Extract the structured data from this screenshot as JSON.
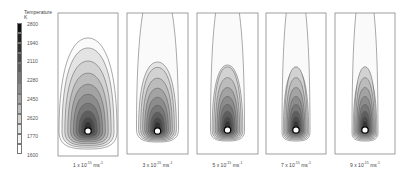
{
  "legend": {
    "title": "Temperature",
    "unit": "K",
    "labels": [
      "2800",
      "1940",
      "2110",
      "2280",
      "2450",
      "2620",
      "1770",
      "1600"
    ],
    "shades": [
      "#111111",
      "#222222",
      "#333333",
      "#4a4a4a",
      "#5e5e5e",
      "#777777",
      "#8c8c8c",
      "#a3a3a3",
      "#bcbcbc",
      "#d2d2d2",
      "#e4e4e4",
      "#f2f2f2",
      "#ffffff"
    ]
  },
  "panels": [
    {
      "label_base": "1 x 10",
      "label_exp": "-15",
      "label_unit": "ms",
      "label_unit_exp": "-1",
      "plume": "wide"
    },
    {
      "label_base": "3 x 10",
      "label_exp": "-15",
      "label_unit": "ms",
      "label_unit_exp": "-1",
      "plume": "medium"
    },
    {
      "label_base": "5 x 10",
      "label_exp": "-15",
      "label_unit": "ms",
      "label_unit_exp": "-1",
      "plume": "narrow"
    },
    {
      "label_base": "7 x 10",
      "label_exp": "-15",
      "label_unit": "ms",
      "label_unit_exp": "-1",
      "plume": "narrower"
    },
    {
      "label_base": "9 x 10",
      "label_exp": "-15",
      "label_unit": "ms",
      "label_unit_exp": "-1",
      "plume": "narrowest"
    }
  ]
}
